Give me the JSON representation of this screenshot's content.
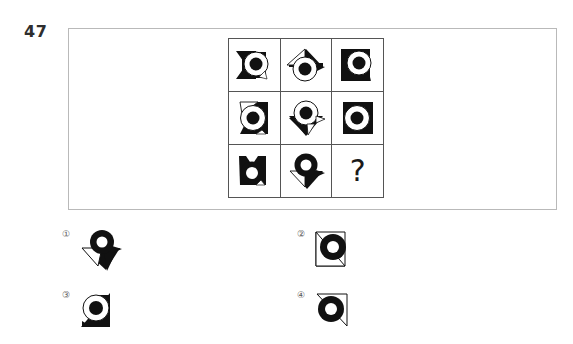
{
  "question": {
    "number": "47",
    "type": "figure-matrix-reasoning"
  },
  "matrix": {
    "rows": 3,
    "columns": 3,
    "cells": [
      {
        "id": "r1c1",
        "icon": "arrow-left-with-ring",
        "ring_fill": "white",
        "dot_fill": "black",
        "arrow_fill": "black",
        "description": "black left-pointing arrow behind white ring with black dot"
      },
      {
        "id": "r1c2",
        "icon": "arrow-up-with-ring",
        "ring_fill": "white",
        "dot_fill": "black",
        "arrow_fill": "black",
        "description": "black up-pointing arrow behind white ring with black dot"
      },
      {
        "id": "r1c3",
        "icon": "arrow-left-down-with-ring",
        "ring_fill": "white",
        "dot_fill": "black",
        "arrow_fill": "black",
        "description": "black arrow pointing down-left behind white ring with black dot"
      },
      {
        "id": "r2c1",
        "icon": "arrow-right-outline-with-ring",
        "ring_fill": "white",
        "dot_fill": "black",
        "arrow_fill": "black",
        "description": "black arrow pointing right with white outline wedge, white ring, black dot"
      },
      {
        "id": "r2c2",
        "icon": "arrow-down-with-ring",
        "ring_fill": "white",
        "dot_fill": "black",
        "arrow_fill": "black",
        "description": "black down-pointing arrow with outline, white ring, black dot"
      },
      {
        "id": "r2c3",
        "icon": "arrow-right-up-with-ring",
        "ring_fill": "white",
        "dot_fill": "black",
        "arrow_fill": "black",
        "description": "black arrow pointing up-right behind white ring with black dot"
      },
      {
        "id": "r3c1",
        "icon": "black-blob-with-white-ring",
        "ring_fill": "black",
        "dot_fill": "white",
        "arrow_fill": "black",
        "description": "solid black shape with white inner ring"
      },
      {
        "id": "r3c2",
        "icon": "arrow-down-solid-with-white-ring",
        "ring_fill": "black",
        "dot_fill": "white",
        "arrow_fill": "black",
        "description": "solid black down arrow with white ring hole"
      },
      {
        "id": "r3c3",
        "icon": "question-mark",
        "ring_fill": "none",
        "dot_fill": "none",
        "arrow_fill": "none",
        "description": "missing figure placeholder",
        "text": "?"
      }
    ],
    "missing_cell_text": "?"
  },
  "options": [
    {
      "number": "①",
      "id": "option-1",
      "icon": "arrow-down-right-solid-with-white-ring",
      "description": "solid black down-right arrow with outlined wedge and white ring hole"
    },
    {
      "number": "②",
      "id": "option-2",
      "icon": "arrow-down-left-outline-with-black-ring",
      "description": "outlined wedge pointing down-left with thick black ring"
    },
    {
      "number": "③",
      "id": "option-3",
      "icon": "arrow-down-right-solid-with-white-ring-dot",
      "description": "solid black wedge with white ring and black dot"
    },
    {
      "number": "④",
      "id": "option-4",
      "icon": "arrow-up-right-outline-with-black-ring",
      "description": "outlined wedge pointing up-right with thick black ring"
    }
  ],
  "colors": {
    "ink": "#1a1a1a",
    "frame_border": "#b9b9b9",
    "matrix_border": "#555555",
    "label_gray": "#5a5a5a",
    "page_background": "#ffffff"
  }
}
